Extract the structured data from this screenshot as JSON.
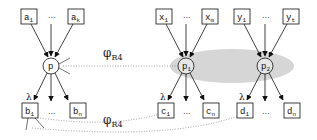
{
  "diagram": {
    "mapping_label": "φ",
    "mapping_sub": "R4",
    "lambda": "λ",
    "ellipsis": "...",
    "left": {
      "node": "p",
      "inputs": [
        {
          "base": "a",
          "sub": "1"
        },
        {
          "base": "a",
          "sub": "k"
        }
      ],
      "outputs": [
        {
          "base": "b",
          "sub": "1"
        },
        {
          "base": "b",
          "sub": "n"
        }
      ]
    },
    "right": {
      "nodes": [
        {
          "node_base": "p",
          "node_sub": "1",
          "inputs": [
            {
              "base": "x",
              "sub": "1"
            },
            {
              "base": "x",
              "sub": "m"
            }
          ],
          "outputs": [
            {
              "base": "c",
              "sub": "1"
            },
            {
              "base": "c",
              "sub": "n"
            }
          ]
        },
        {
          "node_base": "p",
          "node_sub": "2",
          "inputs": [
            {
              "base": "y",
              "sub": "1"
            },
            {
              "base": "y",
              "sub": "t"
            }
          ],
          "outputs": [
            {
              "base": "d",
              "sub": "1"
            },
            {
              "base": "d",
              "sub": "n"
            }
          ]
        }
      ]
    },
    "colors": {
      "group_fill": "#d4d4d4",
      "stroke": "#111111",
      "dotted": "#888888"
    }
  }
}
